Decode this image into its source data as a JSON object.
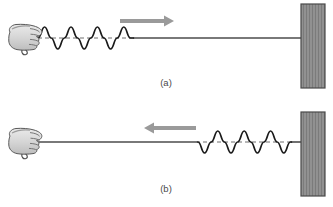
{
  "figure": {
    "background_color": "#ffffff",
    "width": 333,
    "height": 207,
    "panels": [
      {
        "id": "panel-a",
        "label": "(a)",
        "label_x": 166,
        "label_y": 86,
        "description": "Hand shakes rope; wave pulse travels toward the wall",
        "baseline_y": 38,
        "rope": {
          "start_x": 38,
          "end_x": 301,
          "color": "#4d4d4d",
          "width": 1.6
        },
        "wave": {
          "start_x": 40,
          "end_x": 133,
          "cycles": 3.5,
          "amplitude": 11,
          "phase": "crest-first",
          "color": "#1a1a1a",
          "width": 1.6
        },
        "dashed_axis": {
          "start_x": 38,
          "end_x": 135,
          "color": "#6e6e6e",
          "dash": "4 3"
        },
        "arrow": {
          "direction": "right",
          "x_start": 120,
          "x_end": 172,
          "y": 21,
          "color": "#9a9a9a",
          "thickness": 4
        },
        "hand": {
          "x": 8,
          "y": 24,
          "width": 36,
          "height": 34,
          "grip": "fist-holding-rope-end"
        },
        "wall": {
          "x": 301,
          "y": 4,
          "width": 24,
          "height": 84,
          "fill": "#8a8a8a",
          "border": "#4a4a4a",
          "hatch": "vertical-lines"
        }
      },
      {
        "id": "panel-b",
        "label": "(b)",
        "label_x": 166,
        "label_y": 192,
        "description": "Reflected wave inverted and travels back toward the hand",
        "baseline_y": 142,
        "rope": {
          "start_x": 38,
          "end_x": 301,
          "color": "#4d4d4d",
          "width": 1.6
        },
        "wave": {
          "start_x": 198,
          "end_x": 291,
          "cycles": 3.5,
          "amplitude": 11,
          "phase": "trough-first",
          "color": "#1a1a1a",
          "width": 1.6
        },
        "dashed_axis": {
          "start_x": 196,
          "end_x": 293,
          "color": "#6e6e6e",
          "dash": "4 3"
        },
        "arrow": {
          "direction": "left",
          "x_start": 196,
          "x_end": 144,
          "y": 128,
          "color": "#9a9a9a",
          "thickness": 4
        },
        "hand": {
          "x": 8,
          "y": 128,
          "width": 36,
          "height": 34,
          "grip": "fist-holding-rope-end"
        },
        "wall": {
          "x": 301,
          "y": 112,
          "width": 24,
          "height": 84,
          "fill": "#8a8a8a",
          "border": "#4a4a4a",
          "hatch": "vertical-lines"
        }
      }
    ],
    "colors": {
      "rope": "#4d4d4d",
      "wave": "#1a1a1a",
      "arrow": "#9a9a9a",
      "wall_fill": "#8a8a8a",
      "wall_border": "#4a4a4a",
      "hand_fill": "#d8d8d8",
      "hand_outline": "#5a5a5a",
      "dash": "#6e6e6e",
      "label": "#4a4a4a"
    }
  }
}
